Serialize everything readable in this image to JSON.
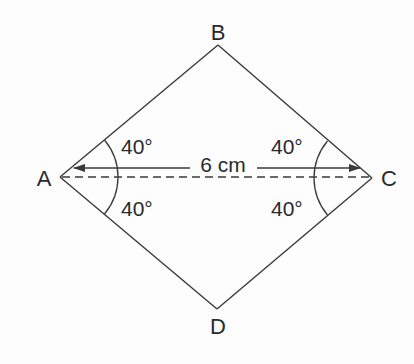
{
  "diagram": {
    "type": "geometry",
    "shape": "quadrilateral ABCD (rhombus)",
    "colors": {
      "stroke": "#3a3a3a",
      "text": "#2a2a2a",
      "background": "#fdfdfd"
    },
    "vertices": {
      "A": {
        "label": "A"
      },
      "B": {
        "label": "B"
      },
      "C": {
        "label": "C"
      },
      "D": {
        "label": "D"
      }
    },
    "diagonal": {
      "from": "A",
      "to": "C",
      "style": "dashed"
    },
    "measurement": {
      "label": "6 cm",
      "between": [
        "A",
        "C"
      ]
    },
    "angles": [
      {
        "at": "A",
        "between": [
          "AB",
          "AC"
        ],
        "label": "40°"
      },
      {
        "at": "A",
        "between": [
          "AC",
          "AD"
        ],
        "label": "40°"
      },
      {
        "at": "C",
        "between": [
          "CB",
          "CA"
        ],
        "label": "40°"
      },
      {
        "at": "C",
        "between": [
          "CA",
          "CD"
        ],
        "label": "40°"
      }
    ]
  }
}
